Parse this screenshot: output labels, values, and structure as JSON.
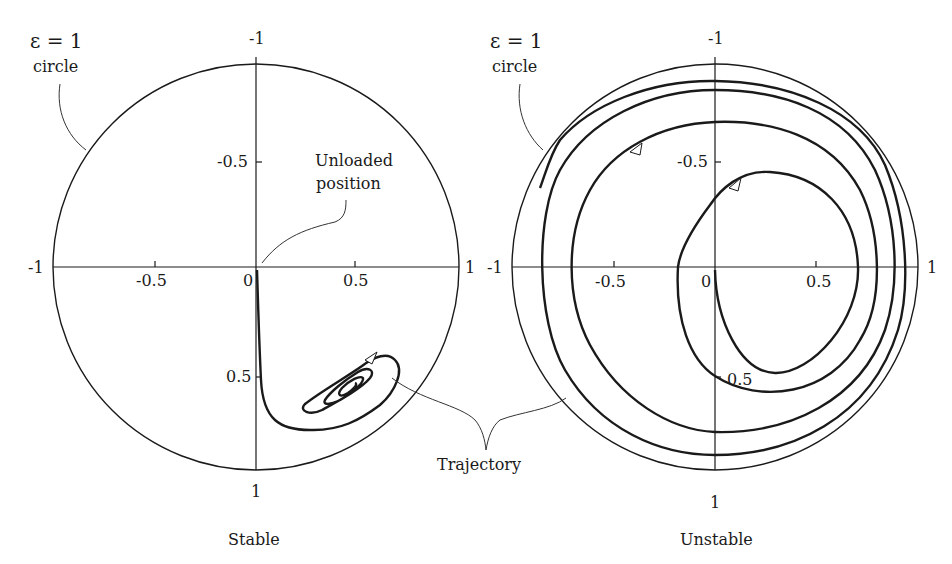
{
  "figure": {
    "left_panel": {
      "caption": "Stable",
      "circle_label_line1": "ε = 1",
      "circle_label_line2": "circle",
      "annotation_line1": "Unloaded",
      "annotation_line2": "position",
      "ticks": {
        "top": "-1",
        "bottom": "1",
        "left": "-1",
        "right": "1",
        "x_neg_half": "-0.5",
        "x_origin": "0",
        "x_pos_half": "0.5",
        "y_neg_half": "-0.5",
        "y_pos_half": "0.5"
      }
    },
    "right_panel": {
      "caption": "Unstable",
      "circle_label_line1": "ε = 1",
      "circle_label_line2": "circle",
      "ticks": {
        "top": "-1",
        "bottom": "1",
        "left": "-1",
        "right": "1",
        "x_neg_half": "-0.5",
        "x_origin": "0",
        "x_pos_half": "0.5",
        "y_neg_half": "-0.5",
        "y_pos_half": "0.5"
      }
    },
    "shared_annotation": "Trajectory",
    "colors": {
      "ink": "#1a1a1a",
      "background": "#ffffff"
    }
  }
}
